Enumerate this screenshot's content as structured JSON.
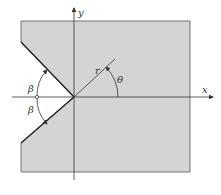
{
  "diagram": {
    "type": "v-notch in plate with polar coordinates",
    "fill_color": "#d4d4d4",
    "stroke_color": "#333333",
    "labels": {
      "x_axis": "x",
      "y_axis": "y",
      "radius": "r",
      "theta": "θ",
      "beta_top": "β",
      "beta_bottom": "β"
    }
  }
}
